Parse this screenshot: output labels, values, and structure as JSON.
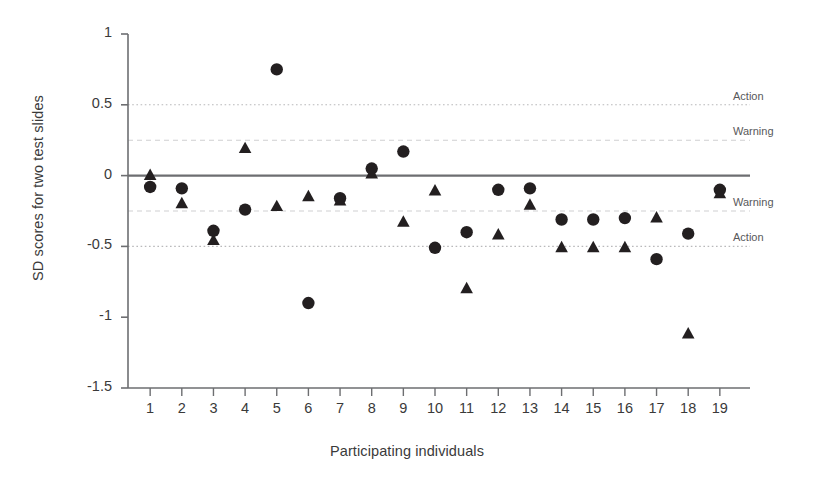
{
  "chart_data": {
    "type": "scatter",
    "title": "",
    "xlabel": "Participating individuals",
    "ylabel": "SD scores for two test slides",
    "xlim": [
      0.3,
      19.7
    ],
    "ylim": [
      -1.5,
      1
    ],
    "grid": true,
    "legend_position": "none",
    "categories": [
      "1",
      "2",
      "3",
      "4",
      "5",
      "6",
      "7",
      "8",
      "9",
      "10",
      "11",
      "12",
      "13",
      "14",
      "15",
      "16",
      "17",
      "18",
      "19"
    ],
    "x": [
      1,
      2,
      3,
      4,
      5,
      6,
      7,
      8,
      9,
      10,
      11,
      12,
      13,
      14,
      15,
      16,
      17,
      18,
      19
    ],
    "xticklabels": [
      "1",
      "2",
      "3",
      "4",
      "5",
      "6",
      "7",
      "8",
      "9",
      "10",
      "11",
      "12",
      "13",
      "14",
      "15",
      "16",
      "17",
      "18",
      "19"
    ],
    "yticks": [
      1,
      0.5,
      0,
      -0.5,
      -1,
      -1.5
    ],
    "yticklabels": [
      "1",
      "0.5",
      "0",
      "-0.5",
      "-1",
      "-1.5"
    ],
    "series": [
      {
        "name": "Test slide 1",
        "marker": "circle",
        "color": "#231f20",
        "values": [
          -0.08,
          -0.09,
          -0.39,
          -0.24,
          0.75,
          -0.9,
          -0.16,
          0.05,
          0.17,
          -0.51,
          -0.4,
          -0.1,
          -0.09,
          -0.31,
          -0.31,
          -0.3,
          -0.59,
          -0.41,
          -0.1
        ]
      },
      {
        "name": "Test slide 2",
        "marker": "triangle",
        "color": "#231f20",
        "values": [
          0.0,
          -0.2,
          -0.46,
          0.19,
          -0.22,
          -0.15,
          -0.18,
          0.01,
          -0.33,
          -0.11,
          -0.8,
          -0.42,
          -0.21,
          -0.51,
          -0.51,
          -0.51,
          -0.3,
          -1.12,
          -0.13
        ]
      }
    ],
    "reference_lines": [
      {
        "name": "action-upper",
        "value": 0.5,
        "label": "Action",
        "style": "dotted",
        "color": "#b9b9bb"
      },
      {
        "name": "warning-upper",
        "value": 0.25,
        "label": "Warning",
        "style": "dashed",
        "color": "#cfcfd1"
      },
      {
        "name": "center",
        "value": 0.0,
        "label": "",
        "style": "solid",
        "color": "#6d6e71"
      },
      {
        "name": "warning-lower",
        "value": -0.25,
        "label": "Warning",
        "style": "dashed",
        "color": "#cfcfd1"
      },
      {
        "name": "action-lower",
        "value": -0.5,
        "label": "Action",
        "style": "dotted",
        "color": "#b9b9bb"
      }
    ]
  }
}
